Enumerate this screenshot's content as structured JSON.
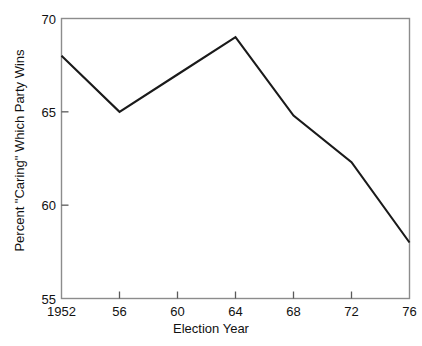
{
  "chart_data": {
    "type": "line",
    "title": "",
    "xlabel": "Election Year",
    "ylabel": "Percent \"Caring\" Which Party Wins",
    "x": [
      1952,
      1956,
      1960,
      1964,
      1968,
      1972,
      1976
    ],
    "xtick_labels": [
      "1952",
      "56",
      "60",
      "64",
      "68",
      "72",
      "76"
    ],
    "ytick_labels": [
      "70",
      "65",
      "60",
      "55"
    ],
    "yticks": [
      70,
      65,
      60,
      55
    ],
    "values": [
      68,
      65,
      67,
      69,
      64.8,
      62.3,
      58
    ],
    "series": [
      {
        "name": "Percent \"Caring\" Which Party Wins",
        "values": [
          68,
          65,
          67,
          69,
          64.8,
          62.3,
          58
        ]
      }
    ],
    "xlim": [
      1952,
      1976
    ],
    "ylim": [
      55,
      70
    ],
    "grid": false,
    "legend": "none",
    "line_color": "#1a1a1a",
    "frame_color": "#8c8c8c",
    "markers": "none"
  }
}
